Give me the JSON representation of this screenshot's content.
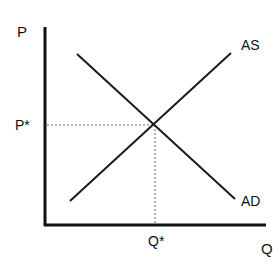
{
  "diagram": {
    "type": "aggregate supply and aggregate demand",
    "axes": {
      "y_label": "P",
      "x_label": "Q"
    },
    "equilibrium": {
      "price_label": "P*",
      "quantity_label": "Q*"
    },
    "curves": [
      {
        "name": "AS",
        "label": "AS",
        "slope": "upward"
      },
      {
        "name": "AD",
        "label": "AD",
        "slope": "downward"
      }
    ],
    "colors": {
      "line": "#1a1a1a",
      "guide": "#555555",
      "background": "#ffffff"
    }
  }
}
